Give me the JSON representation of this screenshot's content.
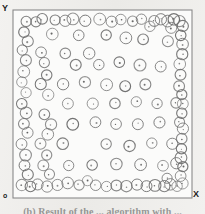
{
  "figure": {
    "title": "",
    "caption": "(b) Result of the ... algorithm with ...",
    "axis_labels": {
      "x": "X",
      "y": "Y",
      "origin": "o"
    },
    "frame": {
      "left": 13,
      "top": 10,
      "right": 192,
      "bottom": 198
    },
    "colors": {
      "paper": "#efeeec",
      "plot_background": "#fbfbfa",
      "frame_stroke": "#8a8a8a",
      "circle_stroke": "#6f6f6f",
      "center_dot": "#4a4a4a",
      "label_text": "#1a1a1a"
    }
  },
  "chart_data": {
    "type": "scatter",
    "title": "",
    "xlabel": "X",
    "ylabel": "Y",
    "xlim": [
      0,
      100
    ],
    "ylim": [
      0,
      100
    ],
    "grid": false,
    "legend": null,
    "marker": {
      "shape": "circle-with-center-dot",
      "radius_px": 5.5,
      "filled": false
    },
    "point_count": 121,
    "points": [
      [
        5,
        96
      ],
      [
        11,
        96
      ],
      [
        15,
        97
      ],
      [
        22,
        97
      ],
      [
        28,
        96
      ],
      [
        33,
        97
      ],
      [
        40,
        96
      ],
      [
        48,
        97
      ],
      [
        55,
        96
      ],
      [
        61,
        97
      ],
      [
        68,
        96
      ],
      [
        73,
        97
      ],
      [
        80,
        96
      ],
      [
        84,
        97
      ],
      [
        88,
        96
      ],
      [
        92,
        97
      ],
      [
        95,
        96
      ],
      [
        97,
        93
      ],
      [
        90,
        92
      ],
      [
        78,
        93
      ],
      [
        4,
        90
      ],
      [
        21,
        89
      ],
      [
        36,
        88
      ],
      [
        52,
        88
      ],
      [
        64,
        87
      ],
      [
        74,
        86
      ],
      [
        88,
        85
      ],
      [
        96,
        88
      ],
      [
        6,
        85
      ],
      [
        97,
        83
      ],
      [
        3,
        80
      ],
      [
        14,
        79
      ],
      [
        28,
        78
      ],
      [
        42,
        78
      ],
      [
        97,
        78
      ],
      [
        5,
        74
      ],
      [
        16,
        73
      ],
      [
        34,
        72
      ],
      [
        48,
        72
      ],
      [
        60,
        73
      ],
      [
        72,
        72
      ],
      [
        84,
        71
      ],
      [
        95,
        72
      ],
      [
        4,
        68
      ],
      [
        17,
        66
      ],
      [
        96,
        66
      ],
      [
        3,
        62
      ],
      [
        14,
        61
      ],
      [
        27,
        61
      ],
      [
        40,
        62
      ],
      [
        52,
        61
      ],
      [
        63,
        60
      ],
      [
        75,
        61
      ],
      [
        95,
        60
      ],
      [
        5,
        56
      ],
      [
        18,
        55
      ],
      [
        96,
        55
      ],
      [
        3,
        50
      ],
      [
        30,
        50
      ],
      [
        44,
        50
      ],
      [
        57,
        50
      ],
      [
        70,
        51
      ],
      [
        82,
        50
      ],
      [
        93,
        51
      ],
      [
        97,
        50
      ],
      [
        5,
        45
      ],
      [
        16,
        44
      ],
      [
        96,
        45
      ],
      [
        4,
        39
      ],
      [
        20,
        39
      ],
      [
        33,
        39
      ],
      [
        46,
        40
      ],
      [
        58,
        39
      ],
      [
        71,
        39
      ],
      [
        83,
        40
      ],
      [
        95,
        40
      ],
      [
        97,
        36
      ],
      [
        6,
        34
      ],
      [
        18,
        33
      ],
      [
        96,
        31
      ],
      [
        3,
        28
      ],
      [
        14,
        28
      ],
      [
        27,
        28
      ],
      [
        52,
        28
      ],
      [
        66,
        27
      ],
      [
        79,
        28
      ],
      [
        91,
        28
      ],
      [
        96,
        25
      ],
      [
        5,
        22
      ],
      [
        17,
        22
      ],
      [
        96,
        20
      ],
      [
        4,
        16
      ],
      [
        15,
        16
      ],
      [
        30,
        16
      ],
      [
        44,
        16
      ],
      [
        58,
        17
      ],
      [
        72,
        16
      ],
      [
        85,
        16
      ],
      [
        93,
        17
      ],
      [
        97,
        15
      ],
      [
        6,
        11
      ],
      [
        19,
        11
      ],
      [
        96,
        10
      ],
      [
        3,
        5
      ],
      [
        8,
        4
      ],
      [
        12,
        5
      ],
      [
        18,
        4
      ],
      [
        24,
        5
      ],
      [
        30,
        6
      ],
      [
        36,
        5
      ],
      [
        41,
        7
      ],
      [
        46,
        5
      ],
      [
        52,
        4
      ],
      [
        58,
        5
      ],
      [
        64,
        4
      ],
      [
        70,
        5
      ],
      [
        76,
        4
      ],
      [
        81,
        5
      ],
      [
        86,
        4
      ],
      [
        90,
        5
      ],
      [
        94,
        4
      ],
      [
        97,
        6
      ],
      [
        88,
        9
      ]
    ]
  }
}
